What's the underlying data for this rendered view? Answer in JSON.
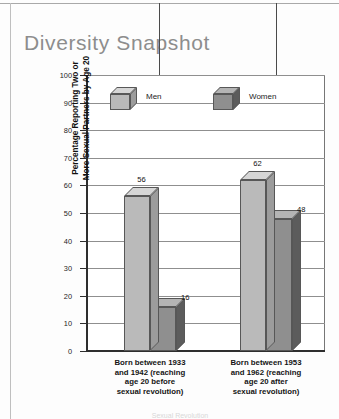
{
  "page": {
    "title": "Diversity Snapshot",
    "title_color": "#8d8d8d",
    "background": "#fdfdfd",
    "footer_partial": "Sexual Revolution"
  },
  "annotations": {
    "left_arrow": "down-arrow-pointing-to-men-1933-bar",
    "right_arrow": "down-arrow-pointing-to-women-1953-bar"
  },
  "legend": {
    "position": "inside-top-of-plot",
    "items": [
      {
        "label": "Men",
        "color": "#bababa",
        "top_color": "#d6d6d6",
        "side_color": "#9c9c9c"
      },
      {
        "label": "Women",
        "color": "#8f8f8f",
        "top_color": "#b4b4b4",
        "side_color": "#5c5c5c"
      }
    ]
  },
  "chart_data": {
    "type": "bar",
    "title": "Diversity Snapshot",
    "subtitle": "",
    "xlabel": "",
    "ylabel": "Percentage Reporting Two or More Sexual Partners by Age 20",
    "ylabel_line1": "Percentage Reporting Two or",
    "ylabel_line2": "More Sexual Partners by Age 20",
    "ylim": [
      0,
      100
    ],
    "ytick_labels": [
      "0",
      "10",
      "20",
      "30",
      "40",
      "50",
      "60",
      "70",
      "80",
      "90",
      "100"
    ],
    "ytick_values": [
      0,
      10,
      20,
      30,
      40,
      50,
      60,
      70,
      80,
      90,
      100
    ],
    "grid": true,
    "grid_axis": "y",
    "legend_position": "top-inside",
    "style": "3d-bars",
    "categories": [
      "Born between 1933 and 1942 (reaching age 20 before sexual revolution)",
      "Born between 1953 and 1962 (reaching age 20 after sexual revolution)"
    ],
    "category_lines": [
      [
        "Born between 1933",
        "and 1942 (reaching",
        "age 20 before",
        "sexual revolution)"
      ],
      [
        "Born between 1953",
        "and 1962 (reaching",
        "age 20 after",
        "sexual revolution)"
      ]
    ],
    "series": [
      {
        "name": "Men",
        "values": [
          56,
          62
        ],
        "color": "#bababa"
      },
      {
        "name": "Women",
        "values": [
          16,
          48
        ],
        "color": "#8f8f8f"
      }
    ],
    "data_labels": [
      "56",
      "16",
      "62",
      "48"
    ]
  }
}
